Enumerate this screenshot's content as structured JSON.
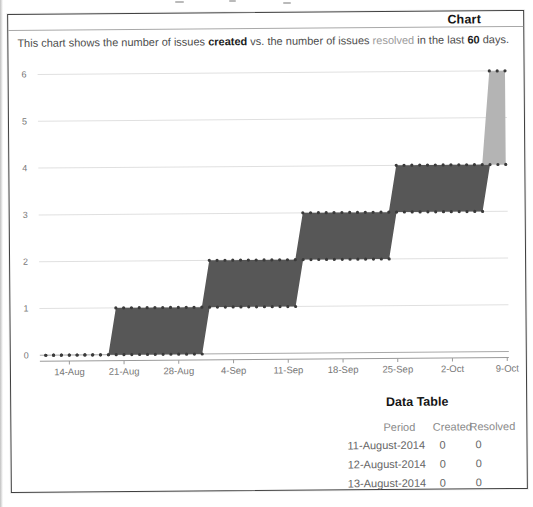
{
  "header": {
    "title": "Chart"
  },
  "description": {
    "parts": [
      {
        "text": "This chart shows the number of issues "
      },
      {
        "text": "created",
        "style": "bold"
      },
      {
        "text": " vs. the number of issues "
      },
      {
        "text": "resolved",
        "style": "muted"
      },
      {
        "text": " in the last "
      },
      {
        "text": "60",
        "style": "bold"
      },
      {
        "text": " days."
      }
    ]
  },
  "chart_data": {
    "type": "area-step",
    "title": "Chart",
    "days_total": 60,
    "ylim": [
      0,
      6
    ],
    "y_ticks": [
      0,
      1,
      2,
      3,
      4,
      5,
      6
    ],
    "x_tick_labels": [
      "14-Aug",
      "21-Aug",
      "28-Aug",
      "4-Sep",
      "11-Sep",
      "18-Sep",
      "25-Sep",
      "2-Oct",
      "9-Oct"
    ],
    "x_tick_days": [
      3,
      10,
      17,
      24,
      31,
      38,
      45,
      52,
      59
    ],
    "grid": true,
    "legend": "none",
    "series": [
      {
        "name": "created",
        "daily_steps": [
          {
            "from_day": 0,
            "value": 0
          },
          {
            "from_day": 9,
            "value": 1
          },
          {
            "from_day": 21,
            "value": 2
          },
          {
            "from_day": 33,
            "value": 3
          },
          {
            "from_day": 45,
            "value": 4
          },
          {
            "from_day": 57,
            "value": 6
          }
        ]
      },
      {
        "name": "resolved",
        "daily_steps": [
          {
            "from_day": 0,
            "value": 0
          },
          {
            "from_day": 21,
            "value": 1
          },
          {
            "from_day": 33,
            "value": 2
          },
          {
            "from_day": 45,
            "value": 3
          },
          {
            "from_day": 57,
            "value": 4
          }
        ]
      }
    ],
    "band_fills": {
      "dark_hex": "#575757",
      "light_hex": "#b4b4b4",
      "light_from_day": 56
    },
    "marker_color": "#3a3a3a",
    "grid_color": "#e0e0e0",
    "zero_line_color": "#a8a8a8",
    "axis_color": "#9a9a9a",
    "tick_label_color": "#777777"
  },
  "data_table": {
    "title": "Data Table",
    "columns": [
      "Period",
      "Created",
      "Resolved"
    ],
    "rows": [
      [
        "11-August-2014",
        "0",
        "0"
      ],
      [
        "12-August-2014",
        "0",
        "0"
      ],
      [
        "13-August-2014",
        "0",
        "0"
      ]
    ]
  }
}
